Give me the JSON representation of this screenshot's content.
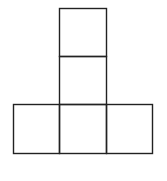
{
  "diagram": {
    "type": "net-of-squares",
    "stroke_color": "#222222",
    "background": "#ffffff",
    "squares": [
      {
        "id": "top",
        "x": 59,
        "y": 8,
        "w": 47,
        "h": 48
      },
      {
        "id": "middle",
        "x": 59,
        "y": 56,
        "w": 47,
        "h": 48
      },
      {
        "id": "bottom-left",
        "x": 13,
        "y": 104,
        "w": 46,
        "h": 49
      },
      {
        "id": "bottom-center",
        "x": 59,
        "y": 104,
        "w": 47,
        "h": 49
      },
      {
        "id": "bottom-right",
        "x": 106,
        "y": 104,
        "w": 46,
        "h": 49
      }
    ]
  }
}
